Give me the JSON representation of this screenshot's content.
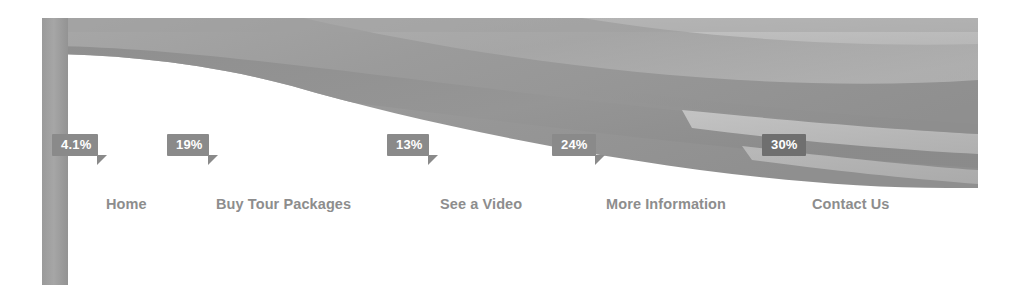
{
  "banner": {
    "name": "hero-banner",
    "description": "abstract grey wave band graphic",
    "colors": {
      "band_dark": "#8f8f8f",
      "band_mid": "#a3a3a3",
      "band_light": "#c2c2c2",
      "band_pale": "#d6d6d6",
      "base": "#9c9c9c"
    }
  },
  "side_stripe": {
    "color": "#9f9f9f"
  },
  "nav": {
    "items": [
      {
        "label": "Home",
        "left": 38,
        "percent": "4.1%"
      },
      {
        "label": "Buy Tour Packages",
        "left": 148,
        "percent": "19%"
      },
      {
        "label": "See a Video",
        "left": 372,
        "percent": "13%"
      },
      {
        "label": "More Information",
        "left": 538,
        "percent": "24%"
      },
      {
        "label": "Contact Us",
        "left": 744,
        "percent": "30%"
      }
    ],
    "text_color": "#8d8d8d"
  },
  "badges": [
    {
      "value": "4.1%",
      "left": 52,
      "top": 134,
      "width": 46,
      "on_dark": false
    },
    {
      "value": "19%",
      "left": 167,
      "top": 134,
      "width": 42,
      "on_dark": false
    },
    {
      "value": "13%",
      "left": 387,
      "top": 134,
      "width": 42,
      "on_dark": false
    },
    {
      "value": "24%",
      "left": 552,
      "top": 134,
      "width": 44,
      "on_dark": false
    },
    {
      "value": "30%",
      "left": 762,
      "top": 134,
      "width": 44,
      "on_dark": true
    }
  ],
  "badge_style": {
    "background": "#8a8a8a",
    "background_on_dark": "#6f6f6f",
    "text_color": "#ffffff"
  }
}
